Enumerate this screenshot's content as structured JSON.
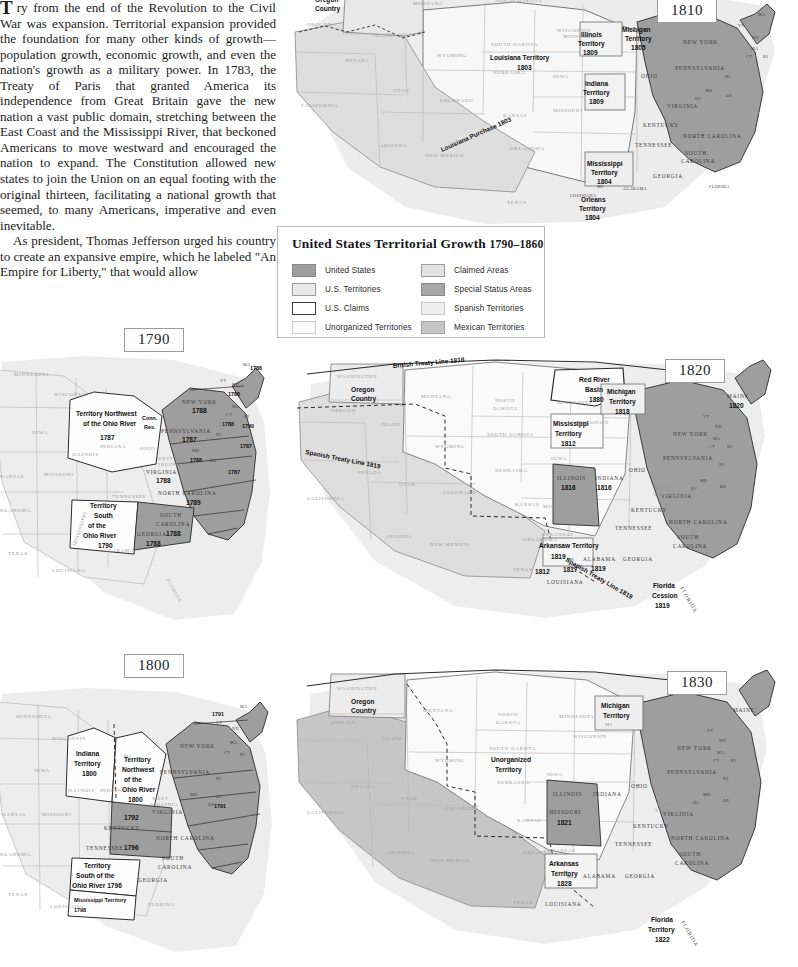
{
  "article": {
    "dropcap": "T",
    "paragraph_1": "ry from the end of the Revolution to the Civil War was expansion. Territorial expansion provided the foundation for many other kinds of growth—population growth, economic growth, and even the nation's growth as a military power. In 1783, the Treaty of Paris that granted America its independence from Great Britain gave the new nation a vast public domain, stretching between the East Coast and the Mississippi River, that beckoned Americans to move westward and encouraged the nation to expand. The Constitution allowed new states to join the Union on an equal footing with the original thirteen, facilitating a national growth that seemed, to many Americans, imperative and even inevitable.",
    "paragraph_2": "As president, Thomas Jefferson urged his country to create an expansive empire, which he labeled \"An Empire for Liberty,\" that would allow"
  },
  "legend": {
    "title": "United States Territorial Growth",
    "title_years": "1790–1860",
    "items": [
      {
        "label": "United States",
        "color": "#9e9e9e",
        "border": "#8a8a8a"
      },
      {
        "label": "U.S. Territories",
        "color": "#eaeaea",
        "border": "#9c9c9c"
      },
      {
        "label": "U.S. Claims",
        "color": "#ffffff",
        "border": "#3a3a3a"
      },
      {
        "label": "Unorganized Territories",
        "color": "#fdfdfd",
        "border": "#cccccc"
      },
      {
        "label": "Claimed Areas",
        "color": "#e2e2e2",
        "border": "#9c9c9c"
      },
      {
        "label": "Special Status Areas",
        "color": "#a8a8a8",
        "border": "#8a8a8a"
      },
      {
        "label": "Spanish Territories",
        "color": "#efefef",
        "border": "#c8c8c8"
      },
      {
        "label": "Mexican Territories",
        "color": "#c6c6c6",
        "border": "#a4a4a4"
      }
    ]
  },
  "maps": {
    "m1790": {
      "year": "1790",
      "states_faint": [
        "MINNESOTA",
        "WISCONSIN",
        "IOWA",
        "ILLINOIS",
        "INDIANA",
        "OHIO",
        "MI",
        "KANSAS",
        "MISSOURI",
        "OKLAHOMA",
        "TEXAS",
        "LOUISIANA",
        "ALABAMA",
        "MISSISSIPPI",
        "TENNESSEE",
        "FLORIDA",
        "WEST VIRGINIA"
      ],
      "labels": [
        {
          "text": "Territory Northwest",
          "sub": "of the Ohio River",
          "date": "1787"
        },
        {
          "text": "Conn.",
          "sub": "Res.",
          "date": ""
        },
        {
          "text": "Territory",
          "sub": "South of the Ohio River",
          "date": "1790"
        }
      ],
      "states_dark": [
        {
          "name": "NEW YORK",
          "date": "1788"
        },
        {
          "name": "PENNSYLVANIA",
          "date": "1787"
        },
        {
          "name": "VIRGINIA",
          "date": "1788"
        },
        {
          "name": "NORTH CAROLINA",
          "date": "1789"
        },
        {
          "name": "SOUTH CAROLINA",
          "date": "1788"
        },
        {
          "name": "GEORGIA",
          "date": "1788"
        },
        {
          "name": "MD",
          "date": "1788"
        },
        {
          "name": "NH",
          "date": "1788"
        },
        {
          "name": "CT",
          "date": "1788"
        },
        {
          "name": "VT",
          "date": ""
        },
        {
          "name": "MA",
          "date": "1788"
        },
        {
          "name": "RI",
          "date": "1790"
        },
        {
          "name": "NJ",
          "date": "1787"
        },
        {
          "name": "DE",
          "date": "1787"
        }
      ],
      "edge_dates": [
        "1788",
        "1790",
        "1787",
        "1787"
      ]
    },
    "m1800": {
      "year": "1800",
      "labels": [
        {
          "text": "Indiana Territory",
          "date": "1800"
        },
        {
          "text": "Territory Northwest of the Ohio River",
          "date": "1800"
        },
        {
          "text": "Territory South of the Ohio River",
          "date": "1796"
        },
        {
          "text": "Mississippi Territory",
          "date": "1798"
        }
      ],
      "states_dark": [
        {
          "name": "NEW YORK",
          "date": ""
        },
        {
          "name": "PENNSYLVANIA",
          "date": ""
        },
        {
          "name": "VIRGINIA",
          "date": ""
        },
        {
          "name": "NORTH CAROLINA",
          "date": ""
        },
        {
          "name": "SOUTH CAROLINA",
          "date": ""
        },
        {
          "name": "GEORGIA",
          "date": ""
        },
        {
          "name": "KENTUCKY",
          "date": "1792"
        },
        {
          "name": "TENNESSEE",
          "date": "1796"
        },
        {
          "name": "VT",
          "date": "1791"
        },
        {
          "name": "DC",
          "date": "1791"
        }
      ]
    },
    "m1810": {
      "year": "1810",
      "labels": [
        {
          "text": "Oregon Country",
          "date": ""
        },
        {
          "text": "Louisiana Territory",
          "date": "1803"
        },
        {
          "text": "Louisiana Purchase 1803",
          "date": ""
        },
        {
          "text": "Illinois Territory",
          "date": "1809"
        },
        {
          "text": "Michigan Territory",
          "date": "1805"
        },
        {
          "text": "Indiana Territory",
          "date": "1809"
        },
        {
          "text": "Mississippi Territory",
          "date": "1804"
        },
        {
          "text": "Orleans Territory",
          "date": "1804"
        }
      ],
      "states_dark": [
        "NEW YORK",
        "PENNSYLVANIA",
        "OHIO",
        "VIRGINIA",
        "KENTUCKY",
        "TENNESSEE",
        "NORTH CAROLINA",
        "SOUTH CAROLINA",
        "GEORGIA",
        "MD",
        "DC",
        "VT",
        "NH",
        "MA",
        "CT",
        "RI",
        "NJ",
        "DE"
      ]
    },
    "m1820": {
      "year": "1820",
      "labels": [
        {
          "text": "British Treaty Line 1818",
          "date": ""
        },
        {
          "text": "Spanish Treaty Line 1819",
          "date": ""
        },
        {
          "text": "Oregon Country",
          "date": ""
        },
        {
          "text": "Red River Basin",
          "date": "1880"
        },
        {
          "text": "Mississippi Territory",
          "date": "1812"
        },
        {
          "text": "Michigan Territory",
          "date": "1818"
        },
        {
          "text": "Arkansaw Territory",
          "date": "1819"
        },
        {
          "text": "Florida Cession",
          "date": "1819"
        }
      ],
      "states_dark": [
        {
          "name": "MAINE",
          "date": "1820"
        },
        {
          "name": "ILLINOIS",
          "date": "1816"
        },
        {
          "name": "INDIANA",
          "date": "1816"
        },
        {
          "name": "ALABAMA",
          "date": "1819"
        },
        {
          "name": "MS",
          "date": "1817"
        },
        {
          "name": "LOUISIANA",
          "date": "1812"
        },
        {
          "name": "MISSOURI",
          "date": ""
        },
        {
          "name": "OHIO",
          "date": ""
        },
        {
          "name": "PENNSYLVANIA",
          "date": ""
        },
        {
          "name": "NEW YORK",
          "date": ""
        },
        {
          "name": "VIRGINIA",
          "date": ""
        },
        {
          "name": "KENTUCKY",
          "date": ""
        },
        {
          "name": "TENNESSEE",
          "date": ""
        },
        {
          "name": "NORTH CAROLINA",
          "date": ""
        },
        {
          "name": "SOUTH CAROLINA",
          "date": ""
        },
        {
          "name": "GEORGIA",
          "date": ""
        }
      ]
    },
    "m1830": {
      "year": "1830",
      "labels": [
        {
          "text": "Oregon Country",
          "date": ""
        },
        {
          "text": "Unorganized Territory",
          "date": ""
        },
        {
          "text": "Michigan Territory",
          "date": ""
        },
        {
          "text": "Arkansas Territory",
          "date": "1828"
        },
        {
          "text": "Florida Territory",
          "date": "1822"
        }
      ],
      "states_dark": [
        {
          "name": "MISSOURI",
          "date": "1821"
        },
        {
          "name": "MAINE",
          "date": ""
        },
        {
          "name": "ILLINOIS",
          "date": ""
        },
        {
          "name": "INDIANA",
          "date": ""
        },
        {
          "name": "OHIO",
          "date": ""
        },
        {
          "name": "ALABAMA",
          "date": ""
        },
        {
          "name": "GEORGIA",
          "date": ""
        },
        {
          "name": "MS",
          "date": ""
        },
        {
          "name": "LOUISIANA",
          "date": ""
        }
      ]
    }
  },
  "colors": {
    "us_states": "#9e9e9e",
    "us_territories": "#eaeaea",
    "us_claims": "#ffffff",
    "unorganized": "#fdfdfd",
    "claimed": "#e2e2e2",
    "special_status": "#a8a8a8",
    "spanish": "#efefef",
    "mexican": "#c6c6c6",
    "outline": "#2b2b2b",
    "faint_outline": "#b0b0b0",
    "ocean_shadow": "#dcdcdc"
  }
}
